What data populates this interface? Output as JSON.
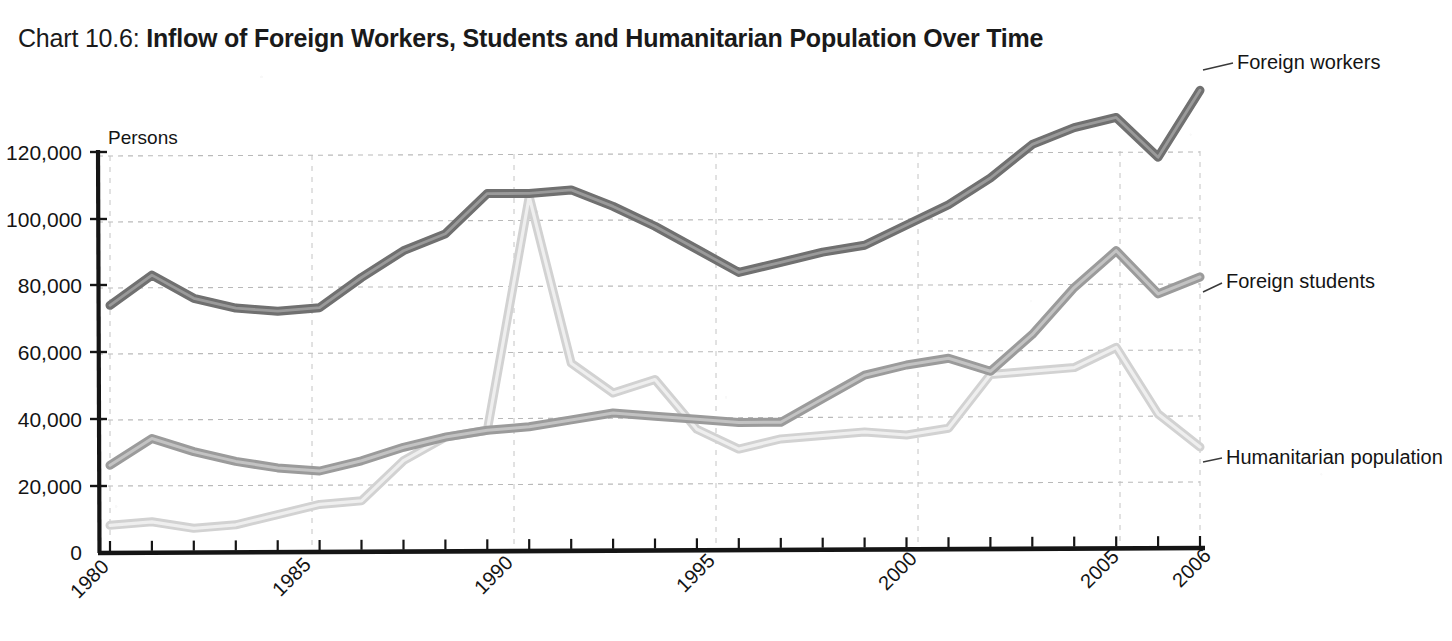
{
  "title": {
    "prefix": "Chart 10.6: ",
    "main": "Inflow of Foreign Workers, Students and Humanitarian Population Over Time"
  },
  "axis": {
    "y_unit_label": "Persons",
    "y_ticks": [
      "0",
      "20,000",
      "40,000",
      "60,000",
      "80,000",
      "100,000",
      "120,000"
    ],
    "x_ticks": [
      "1980",
      "1985",
      "1990",
      "1995",
      "2000",
      "2005",
      "2006"
    ]
  },
  "series_labels": {
    "workers": "Foreign workers",
    "students": "Foreign students",
    "humanitarian": "Humanitarian population"
  },
  "colors": {
    "foreign_workers": "#6f6f6f",
    "foreign_students": "#9b9b9b",
    "humanitarian_population": "#d2d2d2",
    "axis": "#1a1a1a",
    "gridline": "#b9b9b9",
    "leader": "#3a3a3a"
  },
  "chart_data": {
    "type": "line",
    "title": "Chart 10.6: Inflow of Foreign Workers, Students and Humanitarian Population Over Time",
    "xlabel": "",
    "ylabel": "Persons",
    "xlim": [
      1980,
      2006
    ],
    "ylim": [
      0,
      120000
    ],
    "grid": true,
    "legend": "direct-labels-right",
    "x": [
      1980,
      1981,
      1982,
      1983,
      1984,
      1985,
      1986,
      1987,
      1988,
      1989,
      1990,
      1991,
      1992,
      1993,
      1994,
      1995,
      1996,
      1997,
      1998,
      1999,
      2000,
      2001,
      2002,
      2003,
      2004,
      2005,
      2006
    ],
    "series": [
      {
        "name": "Foreign workers",
        "color": "#6f6f6f",
        "values": [
          74000,
          83000,
          76000,
          73000,
          72000,
          73000,
          82000,
          90000,
          95000,
          107000,
          107000,
          108000,
          103000,
          97000,
          90000,
          83000,
          86000,
          89000,
          91000,
          97000,
          103000,
          111000,
          121000,
          126000,
          129000,
          117000,
          137000
        ]
      },
      {
        "name": "Foreign students",
        "color": "#9b9b9b",
        "values": [
          26000,
          34000,
          30000,
          27000,
          25000,
          24000,
          27000,
          31000,
          34000,
          36000,
          37000,
          39000,
          41000,
          40000,
          39000,
          38000,
          38000,
          45000,
          52000,
          55000,
          57000,
          53000,
          64000,
          78000,
          89000,
          76000,
          81000
        ]
      },
      {
        "name": "Humanitarian population",
        "color": "#d2d2d2",
        "values": [
          8000,
          9000,
          7000,
          8000,
          11000,
          14000,
          15000,
          27000,
          34000,
          36000,
          106000,
          56000,
          47000,
          51000,
          36000,
          30000,
          33000,
          34000,
          35000,
          34000,
          36000,
          52000,
          53000,
          54000,
          60000,
          40000,
          30000
        ]
      }
    ],
    "annotations": [
      {
        "text": "Humanitarian population peaks at about 106,000 in 1990",
        "x": 1990,
        "y": 106000
      }
    ]
  }
}
